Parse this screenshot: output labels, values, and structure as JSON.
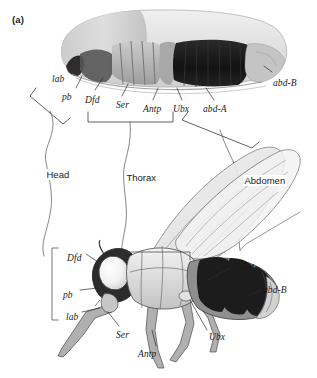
{
  "figure": {
    "panel_label": "(a)",
    "background_color": "#ffffff",
    "ink_color": "#1a1a1a"
  },
  "embryo": {
    "description": "Drosophila embryo lateral view with Hox gene expression domains",
    "gene_labels": [
      {
        "text": "lab",
        "x": 52,
        "y": 74
      },
      {
        "text": "pb",
        "x": 62,
        "y": 92
      },
      {
        "text": "Dfd",
        "x": 85,
        "y": 95
      },
      {
        "text": "Ser",
        "x": 116,
        "y": 100
      },
      {
        "text": "Antp",
        "x": 143,
        "y": 104
      },
      {
        "text": "Ubx",
        "x": 173,
        "y": 104
      },
      {
        "text": "abd-A",
        "x": 203,
        "y": 104
      },
      {
        "text": "abd-B",
        "x": 273,
        "y": 78
      }
    ]
  },
  "body_regions": [
    {
      "text": "Head",
      "x": 45,
      "y": 169
    },
    {
      "text": "Thorax",
      "x": 125,
      "y": 172
    },
    {
      "text": "Abdomen",
      "x": 243,
      "y": 175
    }
  ],
  "adult_fly": {
    "description": "Adult Drosophila lateral view with corresponding Hox gene expression domains",
    "gene_labels": [
      {
        "text": "Dfd",
        "x": 67,
        "y": 253
      },
      {
        "text": "pb",
        "x": 63,
        "y": 290
      },
      {
        "text": "lab",
        "x": 66,
        "y": 312
      },
      {
        "text": "Ser",
        "x": 116,
        "y": 330
      },
      {
        "text": "Antp",
        "x": 138,
        "y": 349
      },
      {
        "text": "Ubx",
        "x": 209,
        "y": 332
      },
      {
        "text": "abd-A",
        "x": 232,
        "y": 263
      },
      {
        "text": "abd-B",
        "x": 263,
        "y": 285
      }
    ]
  },
  "colors": {
    "dark_segment": "#1c1c1c",
    "mid_gray": "#8d8d8d",
    "light_gray": "#d8d8d8",
    "pale": "#efefef",
    "wing": "#e6e6e6"
  }
}
